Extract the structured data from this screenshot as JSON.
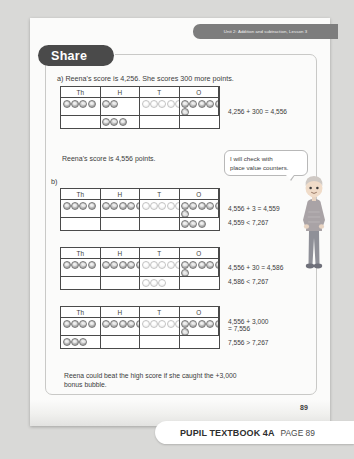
{
  "header": {
    "unit_banner": "Unit 2: Addition and subtraction, Lesson 3"
  },
  "section": {
    "title": "Share"
  },
  "part_a": {
    "label": "a)",
    "prompt": "a)  Reena's score is 4,256. She scores 300 more points.",
    "result_sentence": "Reena's score is 4,556 points.",
    "equation": "4,256 + 300 = 4,556"
  },
  "part_b": {
    "label": "b)"
  },
  "speech_bubble": {
    "line1": "I will check with",
    "line2": "place value counters."
  },
  "tables": [
    {
      "name": "table-a",
      "headers": [
        "Th",
        "H",
        "T",
        "O"
      ],
      "rows": [
        {
          "Th": {
            "count": 4,
            "style": "dark"
          },
          "H": {
            "count": 2,
            "style": "dark"
          },
          "T": {
            "count": 5,
            "style": "light"
          },
          "O": {
            "count": 5,
            "style": "dark",
            "extra": 1
          }
        },
        {
          "Th": {
            "count": 0,
            "style": "dark"
          },
          "H": {
            "count": 3,
            "style": "dark"
          },
          "T": {
            "count": 0,
            "style": "light"
          },
          "O": {
            "count": 0,
            "style": "dark"
          }
        }
      ],
      "equations": [
        "4,256 + 300 = 4,556"
      ]
    },
    {
      "name": "table-b1",
      "headers": [
        "Th",
        "H",
        "T",
        "O"
      ],
      "rows": [
        {
          "Th": {
            "count": 4,
            "style": "dark"
          },
          "H": {
            "count": 5,
            "style": "dark"
          },
          "T": {
            "count": 5,
            "style": "light"
          },
          "O": {
            "count": 5,
            "style": "dark",
            "extra": 1
          }
        },
        {
          "Th": {
            "count": 0,
            "style": "dark"
          },
          "H": {
            "count": 0,
            "style": "dark"
          },
          "T": {
            "count": 0,
            "style": "light"
          },
          "O": {
            "count": 3,
            "style": "dark"
          }
        }
      ],
      "equations": [
        "4,556 + 3 = 4,559",
        "4,559 < 7,267"
      ]
    },
    {
      "name": "table-b2",
      "headers": [
        "Th",
        "H",
        "T",
        "O"
      ],
      "rows": [
        {
          "Th": {
            "count": 4,
            "style": "dark"
          },
          "H": {
            "count": 5,
            "style": "dark"
          },
          "T": {
            "count": 5,
            "style": "light"
          },
          "O": {
            "count": 5,
            "style": "dark",
            "extra": 1
          }
        },
        {
          "Th": {
            "count": 0,
            "style": "dark"
          },
          "H": {
            "count": 0,
            "style": "dark"
          },
          "T": {
            "count": 3,
            "style": "light"
          },
          "O": {
            "count": 0,
            "style": "dark"
          }
        }
      ],
      "equations": [
        "4,556 + 30 = 4,586",
        "4,586 < 7,267"
      ]
    },
    {
      "name": "table-b3",
      "headers": [
        "Th",
        "H",
        "T",
        "O"
      ],
      "rows": [
        {
          "Th": {
            "count": 4,
            "style": "dark"
          },
          "H": {
            "count": 5,
            "style": "dark"
          },
          "T": {
            "count": 5,
            "style": "light"
          },
          "O": {
            "count": 5,
            "style": "dark",
            "extra": 1
          }
        },
        {
          "Th": {
            "count": 3,
            "style": "dark"
          },
          "H": {
            "count": 0,
            "style": "dark"
          },
          "T": {
            "count": 0,
            "style": "light"
          },
          "O": {
            "count": 0,
            "style": "dark"
          }
        }
      ],
      "equations": [
        "4,556 + 3,000",
        "= 7,556",
        "7,556 > 7,267"
      ]
    }
  ],
  "closing": {
    "line1": "Reena could beat the high score if she caught the +3,000",
    "line2": "bonus bubble."
  },
  "footer": {
    "page_number": "89",
    "book_label": "PUPIL TEXTBOOK 4A",
    "page_label": "PAGE 89"
  },
  "colors": {
    "banner": "#7d7d7d",
    "pill": "#4a4a4a",
    "page_bg": "#d9d9d7",
    "sheet": "#fbfbfa",
    "table_border": "#4a4a4a"
  }
}
